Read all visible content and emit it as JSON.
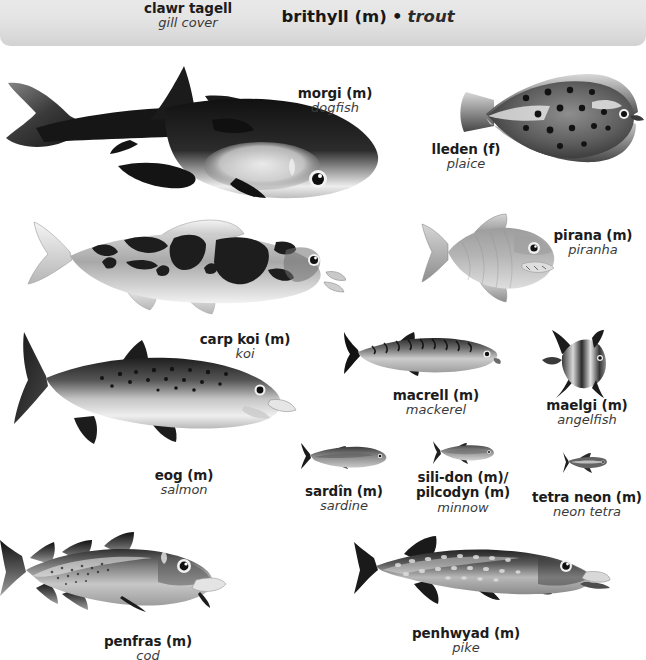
{
  "page": {
    "kind": "illustrated-bilingual-dictionary-plate",
    "topic": "fish",
    "languages": [
      "Welsh",
      "English"
    ]
  },
  "header": {
    "background_color": "#e2e2e2",
    "entries": [
      {
        "term": "clawr tagell",
        "gloss": "gill cover",
        "style": "small"
      },
      {
        "term": "brithyll (m)",
        "separator": "•",
        "gloss": "trout",
        "style": "large"
      }
    ]
  },
  "figures": [
    {
      "id": "dogfish",
      "term": "morgi (m)",
      "gloss": "dogfish",
      "label_lines": [
        "morgi (m)",
        "dogfish"
      ]
    },
    {
      "id": "plaice",
      "term": "lleden (f)",
      "gloss": "plaice",
      "label_lines": [
        "lleden (f)",
        "plaice"
      ]
    },
    {
      "id": "koi",
      "term": "carp koi (m)",
      "gloss": "koi",
      "label_lines": [
        "carp koi (m)",
        "koi"
      ]
    },
    {
      "id": "piranha",
      "term": "pirana (m)",
      "gloss": "piranha",
      "label_lines": [
        "pirana (m)",
        "piranha"
      ]
    },
    {
      "id": "salmon",
      "term": "eog (m)",
      "gloss": "salmon",
      "label_lines": [
        "eog (m)",
        "salmon"
      ]
    },
    {
      "id": "mackerel",
      "term": "macrell (m)",
      "gloss": "mackerel",
      "label_lines": [
        "macrell (m)",
        "mackerel"
      ]
    },
    {
      "id": "angelfish",
      "term": "maelgi (m)",
      "gloss": "angelfish",
      "label_lines": [
        "maelgi (m)",
        "angelfish"
      ]
    },
    {
      "id": "sardine",
      "term": "sardîn (m)",
      "gloss": "sardine",
      "label_lines": [
        "sardîn (m)",
        "sardine"
      ]
    },
    {
      "id": "minnow",
      "term": "sili-don (m)/ pilcodyn (m)",
      "gloss": "minnow",
      "label_lines": [
        "sili-don (m)/",
        "pilcodyn (m)",
        "minnow"
      ]
    },
    {
      "id": "neontetra",
      "term": "tetra neon (m)",
      "gloss": "neon tetra",
      "label_lines": [
        "tetra neon (m)",
        "neon tetra"
      ]
    },
    {
      "id": "cod",
      "term": "penfras (m)",
      "gloss": "cod",
      "label_lines": [
        "penfras (m)",
        "cod"
      ]
    },
    {
      "id": "pike",
      "term": "penhwyad (m)",
      "gloss": "pike",
      "label_lines": [
        "penhwyad (m)",
        "pike"
      ]
    }
  ],
  "palette": {
    "ink": "#1a1a1a",
    "gloss_gray": "#3a3a3a",
    "band_top": "#e9e9e9",
    "band_bottom": "#d2d2d2",
    "fish_dark": "#2a2a2a",
    "fish_mid": "#8a8a8a",
    "fish_light": "#e2e2e2"
  }
}
